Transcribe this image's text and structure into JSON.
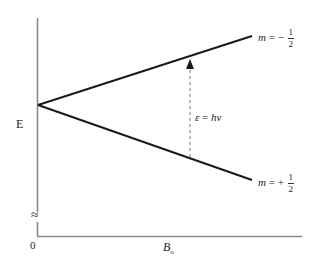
{
  "diagram": {
    "y_axis": {
      "label": "E",
      "break_symbol": "≈"
    },
    "x_axis": {
      "label_main": "B",
      "label_sub": "o",
      "origin_label": "0"
    },
    "levels": [
      {
        "m_symbol": "m",
        "eq": " = ",
        "sign": "−",
        "num": "1",
        "den": "2"
      },
      {
        "m_symbol": "m",
        "eq": " = ",
        "sign": "+",
        "num": "1",
        "den": "2"
      }
    ],
    "transition": {
      "label_eps": "ε",
      "label_eq": " = ",
      "label_h": "hν"
    },
    "colors": {
      "line": "#1a1a1a",
      "axis": "#888888",
      "dashed": "#777777"
    }
  }
}
